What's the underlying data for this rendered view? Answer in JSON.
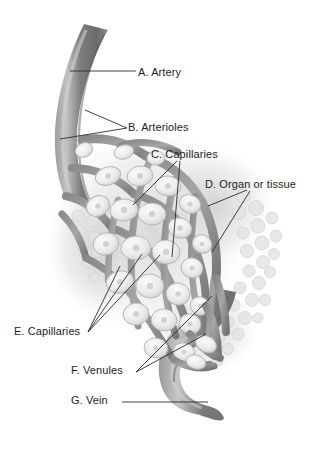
{
  "figure": {
    "background_color": "#ffffff",
    "line_color": "#2b2b2b",
    "text_color": "#1d1d1d",
    "vessel_dark": "#6f6f6f",
    "vessel_mid": "#8e8e8e",
    "vessel_light": "#b9b9b9",
    "cell_fill": "#ececec",
    "tissue_haze": "#d8d8d8"
  },
  "labels": {
    "artery": "A. Artery",
    "arterioles": "B. Arterioles",
    "capillaries_c": "C. Capillaries",
    "organ": "D. Organ or tissue",
    "capillaries_e": "E. Capillaries",
    "venules": "F. Venules",
    "vein": "G. Vein"
  },
  "legend_keys": [
    "A",
    "B",
    "C",
    "D",
    "E",
    "F",
    "G"
  ]
}
